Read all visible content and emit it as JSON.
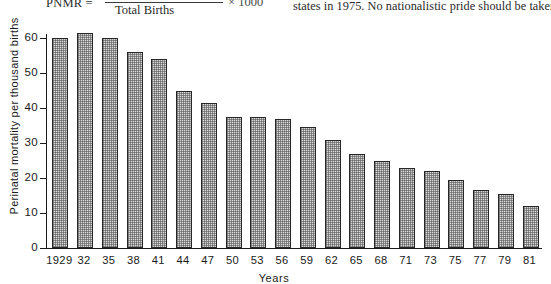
{
  "page": {
    "formula": {
      "lhs": "PNMR =",
      "denominator": "Total Births",
      "multiplier": "× 1000"
    },
    "body_text": "states in 1975. No nationalistic pride should be taken"
  },
  "chart_data": {
    "type": "bar",
    "title": "",
    "xlabel": "Years",
    "ylabel": "Perinatal mortality per thousand births",
    "categories": [
      "1929",
      "32",
      "35",
      "38",
      "41",
      "44",
      "47",
      "50",
      "53",
      "56",
      "59",
      "62",
      "65",
      "68",
      "71",
      "73",
      "75",
      "77",
      "79",
      "81"
    ],
    "values": [
      60,
      61.5,
      60,
      56,
      54,
      45,
      41.5,
      37.5,
      37.5,
      37,
      34.5,
      31,
      27,
      25,
      23,
      22,
      19.5,
      16.5,
      15.5,
      12
    ],
    "ylim": [
      0,
      65
    ],
    "yticks": [
      0,
      10,
      20,
      30,
      40,
      50,
      60
    ],
    "ytick_labels": [
      "0",
      "10",
      "20",
      "30",
      "40",
      "50",
      "60"
    ],
    "grid": false,
    "legend": "none",
    "bar_fill_color": "#d8d8d8",
    "bar_edge_color": "#262626",
    "axis_color": "#1a1a1a"
  }
}
